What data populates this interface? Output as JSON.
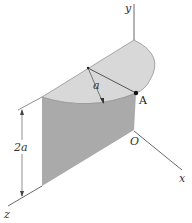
{
  "diagram": {
    "labels": {
      "y_axis": "y",
      "x_axis": "x",
      "z_axis": "z",
      "origin": "O",
      "point_a": "A",
      "radius": "a",
      "height": "2a"
    },
    "colors": {
      "top_face": "#d9d9d9",
      "wall_face": "#a9a9a9",
      "wall_front": "#b8b8b8",
      "line": "#444444"
    }
  }
}
